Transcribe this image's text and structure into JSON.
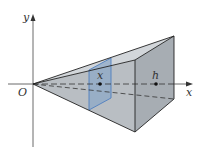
{
  "diagram": {
    "type": "pyramid-cross-section",
    "labels": {
      "y_axis": "y",
      "x_axis": "x",
      "origin": "O",
      "cross_section": "x",
      "base": "h"
    },
    "colors": {
      "solid_fill": "#b9bec3",
      "side_face": "#a7adb3",
      "top_face": "#d2d6da",
      "cross_section_fill": "#8aa6c8",
      "cross_section_edge": "#4f7fbf",
      "edge": "#222222",
      "axis": "#444444"
    }
  }
}
